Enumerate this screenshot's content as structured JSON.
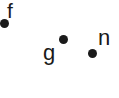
{
  "background_color": "#ffffff",
  "marker_color": "#1a1a1a",
  "label_color": "#1a1a1a",
  "chart_data": {
    "type": "scatter",
    "title": "",
    "subtitle": "",
    "xlabel": "",
    "ylabel": "",
    "grid": false,
    "legend": "none",
    "axes_visible": false,
    "tick_labels": [],
    "xlim": [
      0,
      119
    ],
    "ylim": [
      0,
      98
    ],
    "points": [
      {
        "label": "f",
        "x": 4,
        "y": 24,
        "label_x": 12,
        "label_y": 10
      },
      {
        "label": "g",
        "x": 63,
        "y": 40,
        "label_x": 49,
        "label_y": 55
      },
      {
        "label": "n",
        "x": 92,
        "y": 54,
        "label_x": 105,
        "label_y": 38
      }
    ]
  }
}
